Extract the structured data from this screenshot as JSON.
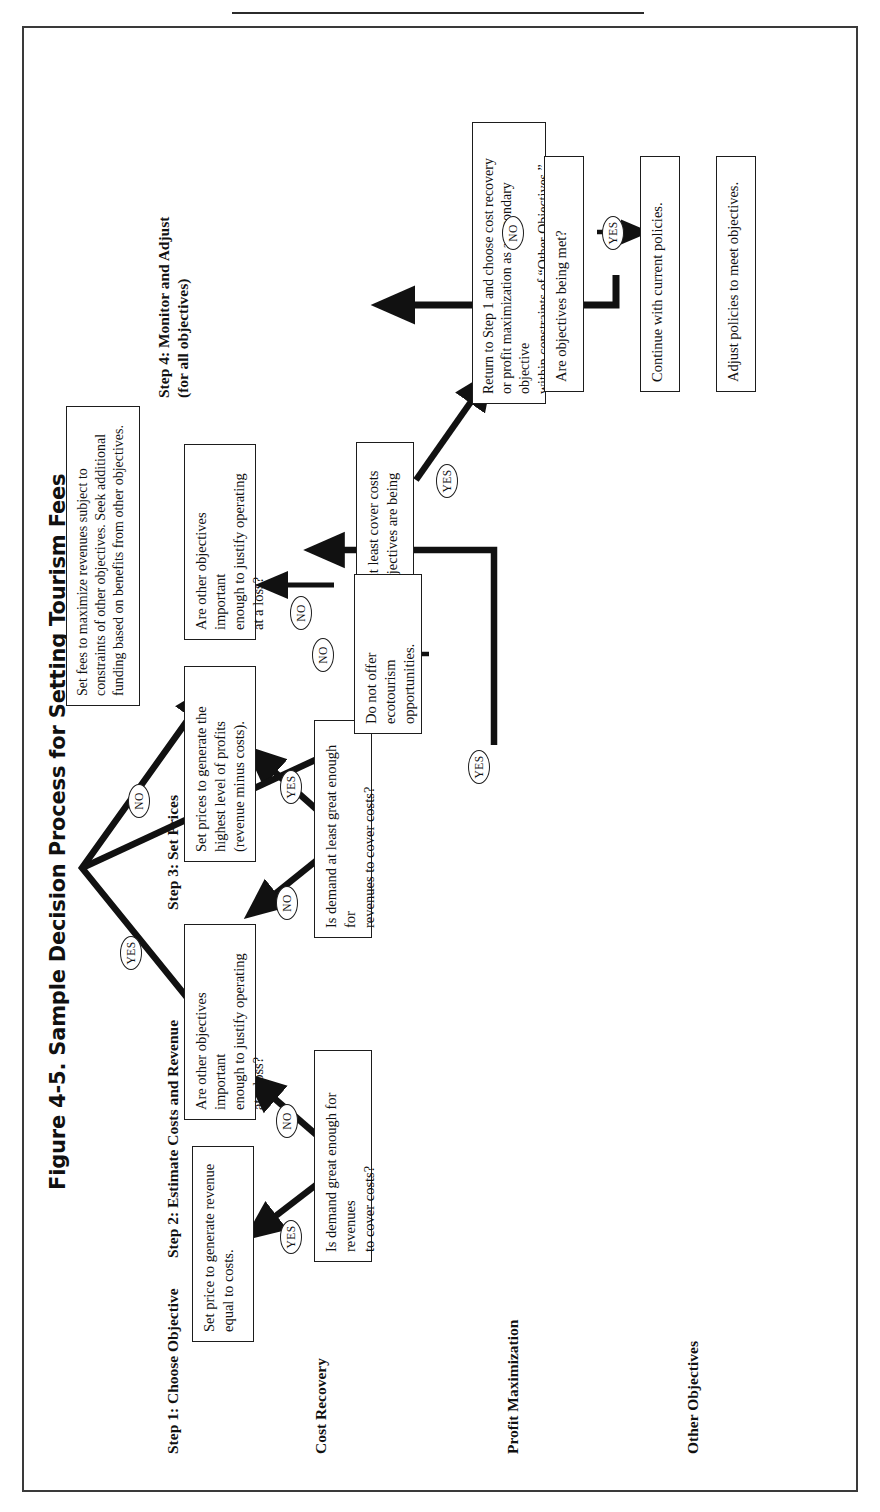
{
  "figure": {
    "title": "Figure 4-5.  Sample Decision Process for Setting Tourism Fees"
  },
  "columns": [
    {
      "id": "step1",
      "label": "Step 1: Choose Objective"
    },
    {
      "id": "step2",
      "label": "Step 2: Estimate Costs and Revenue"
    },
    {
      "id": "step3",
      "label": "Step 3: Set Prices"
    },
    {
      "id": "step4",
      "label": "Step 4:  Monitor and Adjust\n(for all objectives)"
    }
  ],
  "rows": [
    {
      "id": "cost-recovery",
      "label": "Cost Recovery"
    },
    {
      "id": "profit-maximization",
      "label": "Profit Maximization"
    },
    {
      "id": "other-objectives",
      "label": "Other Objectives"
    }
  ],
  "boxes": {
    "cr_demand": "Is demand great enough for revenues\nto cover costs?",
    "cr_setprice": "Set price to generate revenue\nequal to costs.",
    "cr_other_obj": "Are other objectives important\nenough to justify operating\nat a loss?",
    "pm_demand": "Is demand at least great enough for\nrevenues to cover costs?",
    "pm_setprices": "Set prices to generate the\nhighest level of profits\n(revenue minus costs).",
    "pm_other_obj": "Are other objectives important\nenough to justify operating\nat a loss?",
    "oo_revenue": "Will revenue at least cover costs\nwhile other objectives are being met?",
    "oo_return": "Return to Step 1 and choose cost recovery\nor profit maximization as a secondary objective\nwithin constraints of “Other Objectives.”",
    "no_ecotourism": "Do not offer\necotourism\nopportunities.",
    "set_fees_max": "Set fees to maximize revenues subject to\nconstraints of other objectives. Seek additional\nfunding based on benefits from other objectives.",
    "s4_objectives_met": "Are objectives being met?",
    "s4_continue": "Continue with current policies.",
    "s4_adjust": "Adjust policies to meet objectives."
  },
  "tags": {
    "yes": "YES",
    "no": "NO"
  },
  "tag_instances": [
    {
      "id": "cr-yes",
      "text": "YES"
    },
    {
      "id": "cr-no",
      "text": "NO"
    },
    {
      "id": "pm-no",
      "text": "NO"
    },
    {
      "id": "pm-yes",
      "text": "YES"
    },
    {
      "id": "oo-no",
      "text": "NO"
    },
    {
      "id": "oo-yes",
      "text": "YES"
    },
    {
      "id": "crobj-yes",
      "text": "YES"
    },
    {
      "id": "pmobj-no",
      "text": "NO"
    },
    {
      "id": "pmobj-no2",
      "text": "NO"
    },
    {
      "id": "pmobj-yes",
      "text": "YES"
    },
    {
      "id": "s4-yes",
      "text": "YES"
    },
    {
      "id": "s4-no",
      "text": "NO"
    }
  ],
  "colors": {
    "ink": "#111111",
    "frame": "#3a3a3a",
    "box_border": "#1d1d1d",
    "paper": "#ffffff"
  }
}
